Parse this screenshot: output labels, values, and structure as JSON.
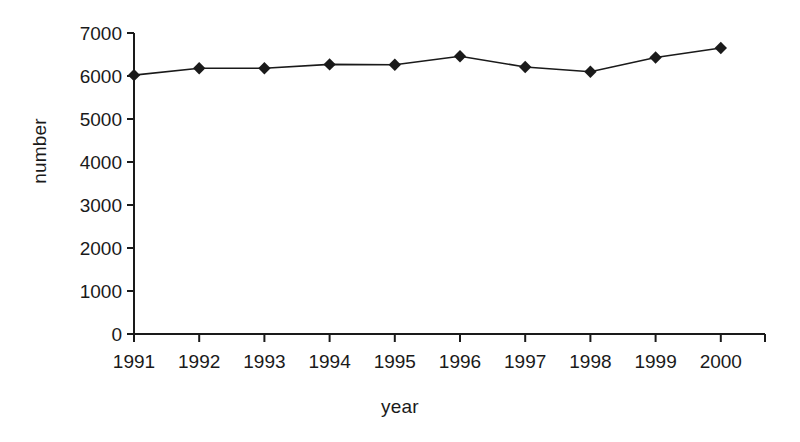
{
  "chart_data": {
    "type": "line",
    "title": "",
    "xlabel": "year",
    "ylabel": "number",
    "categories": [
      "1991",
      "1992",
      "1993",
      "1994",
      "1995",
      "1996",
      "1997",
      "1998",
      "1999",
      "2000"
    ],
    "values": [
      6020,
      6180,
      6180,
      6270,
      6260,
      6460,
      6210,
      6100,
      6430,
      6650
    ],
    "series": [
      {
        "name": "number",
        "values": [
          6020,
          6180,
          6180,
          6270,
          6260,
          6460,
          6210,
          6100,
          6430,
          6650
        ]
      }
    ],
    "ylim": [
      0,
      7000
    ],
    "ytick_labels": [
      "7000",
      "6000",
      "5000",
      "4000",
      "3000",
      "2000",
      "1000",
      "0"
    ],
    "ytick_values": [
      7000,
      6000,
      5000,
      4000,
      3000,
      2000,
      1000,
      0
    ],
    "xtick_labels": [
      "1991",
      "1992",
      "1993",
      "1994",
      "1995",
      "1996",
      "1997",
      "1998",
      "1999",
      "2000"
    ],
    "grid": false,
    "legend": "none",
    "marker": "diamond",
    "line_color": "#1a1a1a",
    "marker_color": "#1a1a1a",
    "background_color": "#ffffff",
    "axis_color": "#1a1a1a"
  },
  "axis_titles": {
    "x": "year",
    "y": "number"
  }
}
